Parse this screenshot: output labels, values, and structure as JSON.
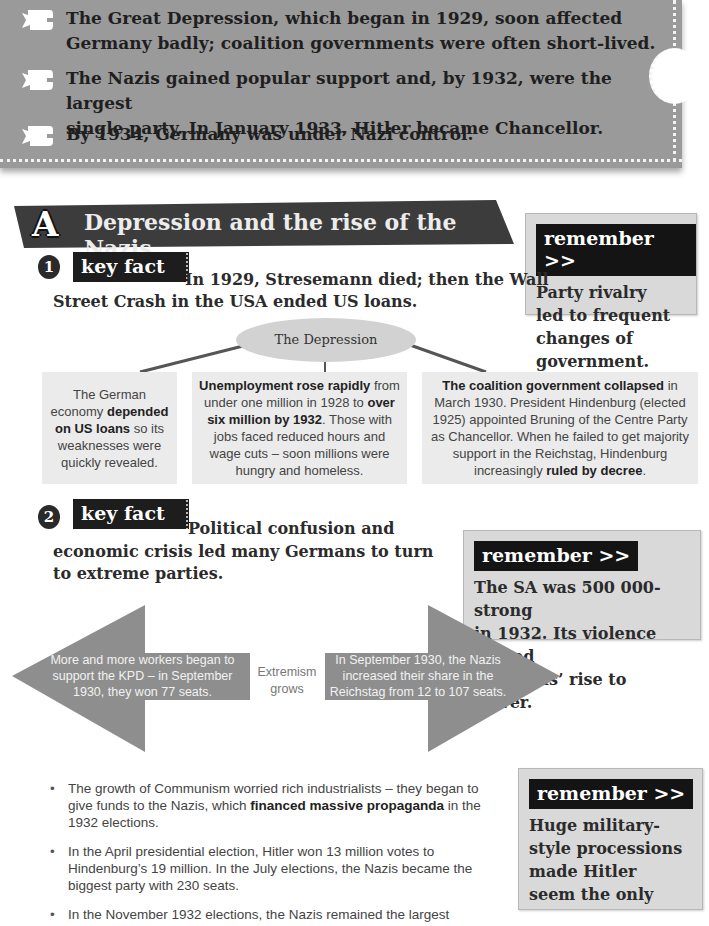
{
  "summary": {
    "icon": "speech-bubble-icon",
    "items": [
      {
        "line1": "The Great Depression, which began in 1929, soon affected",
        "line2": "Germany badly; coalition governments were often short-lived."
      },
      {
        "line1": "The Nazis gained popular support and, by 1932, were the largest",
        "line2": "single party. In January 1933, Hitler became Chancellor."
      },
      {
        "line1": "By 1934, Germany was under Nazi control.",
        "line2": ""
      }
    ]
  },
  "section": {
    "letter": "A",
    "title": "Depression and the rise of the Nazis"
  },
  "key_fact_1": {
    "number": "1",
    "badge": "key fact",
    "line1": "In 1929, Stresemann died; then the Wall",
    "line2": "Street Crash in the USA ended US loans."
  },
  "remember_1": {
    "tag": "remember >>",
    "lines": [
      "Party rivalry",
      "led to frequent",
      "changes of",
      "government."
    ]
  },
  "depression_diagram": {
    "center": "The Depression",
    "boxes": [
      {
        "parts": [
          {
            "t": "The German economy ",
            "b": false
          },
          {
            "t": "depended on US loans",
            "b": true
          },
          {
            "t": " so its weaknesses were quickly revealed.",
            "b": false
          }
        ]
      },
      {
        "parts": [
          {
            "t": "Unemployment rose rapidly",
            "b": true
          },
          {
            "t": " from under one million in 1928 to ",
            "b": false
          },
          {
            "t": "over six million by 1932",
            "b": true
          },
          {
            "t": ". Those with jobs faced reduced hours and wage cuts – soon millions were hungry and homeless.",
            "b": false
          }
        ]
      },
      {
        "parts": [
          {
            "t": "The coalition government collapsed",
            "b": true
          },
          {
            "t": " in March 1930. President Hindenburg (elected 1925) appointed Bruning of the Centre Party as Chancellor. When he failed to get majority support in the Reichstag, Hindenburg increasingly ",
            "b": false
          },
          {
            "t": "ruled by decree",
            "b": true
          },
          {
            "t": ".",
            "b": false
          }
        ]
      }
    ]
  },
  "key_fact_2": {
    "number": "2",
    "badge": "key fact",
    "line1": "Political confusion and",
    "line2": "economic crisis led many Germans to turn",
    "line3": "to extreme parties."
  },
  "remember_2": {
    "tag": "remember >>",
    "lines": [
      "The SA was 500 000-strong",
      "in 1932. Its violence helped",
      "the Nazis’ rise to power."
    ]
  },
  "extremism_diagram": {
    "center": "Extremism grows",
    "left_arrow": "More and more workers began to support the KPD – in September 1930, they won 77 seats.",
    "right_arrow": "In September 1930, the Nazis increased their share in the Reichstag from 12 to 107 seats."
  },
  "bullets": [
    {
      "parts": [
        {
          "t": "The growth of Communism worried rich industrialists – they began to give funds to the Nazis, which ",
          "b": false
        },
        {
          "t": "financed massive propaganda",
          "b": true
        },
        {
          "t": " in the 1932 elections.",
          "b": false
        }
      ]
    },
    {
      "parts": [
        {
          "t": "In the April presidential election, Hitler won 13 million votes to Hindenburg’s 19 million. In the July elections, the Nazis became the biggest party with 230 seats.",
          "b": false
        }
      ]
    },
    {
      "parts": [
        {
          "t": "In the November 1932 elections, the Nazis remained the largest",
          "b": false
        }
      ]
    }
  ],
  "remember_3": {
    "tag": "remember >>",
    "lines": [
      "Huge military-",
      "style processions",
      "made Hitler",
      "seem the only"
    ]
  }
}
